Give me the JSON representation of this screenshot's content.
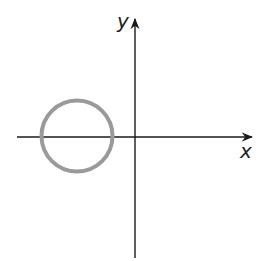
{
  "diagram": {
    "type": "coordinate-plane",
    "x_axis_label": "x",
    "y_axis_label": "y",
    "shapes": [
      {
        "kind": "circle",
        "description": "circle centered on negative x-axis",
        "stroke_color": "#9a9a9a"
      }
    ],
    "colors": {
      "axis": "#1a1a1a",
      "circle": "#9a9a9a",
      "background": "#ffffff"
    }
  }
}
